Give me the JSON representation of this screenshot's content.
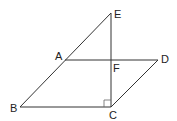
{
  "diagram": {
    "type": "geometry",
    "points": {
      "A": {
        "label": "A",
        "x": 65,
        "y": 60
      },
      "B": {
        "label": "B",
        "x": 20,
        "y": 107
      },
      "C": {
        "label": "C",
        "x": 111,
        "y": 107
      },
      "D": {
        "label": "D",
        "x": 158,
        "y": 60
      },
      "E": {
        "label": "E",
        "x": 111,
        "y": 13
      },
      "F": {
        "label": "F",
        "x": 111,
        "y": 60
      }
    },
    "segments": [
      "BE",
      "AD",
      "BC",
      "CD",
      "EC"
    ],
    "right_angle_at": "C",
    "colors": {
      "line": "#333333",
      "label": "#222222"
    }
  }
}
